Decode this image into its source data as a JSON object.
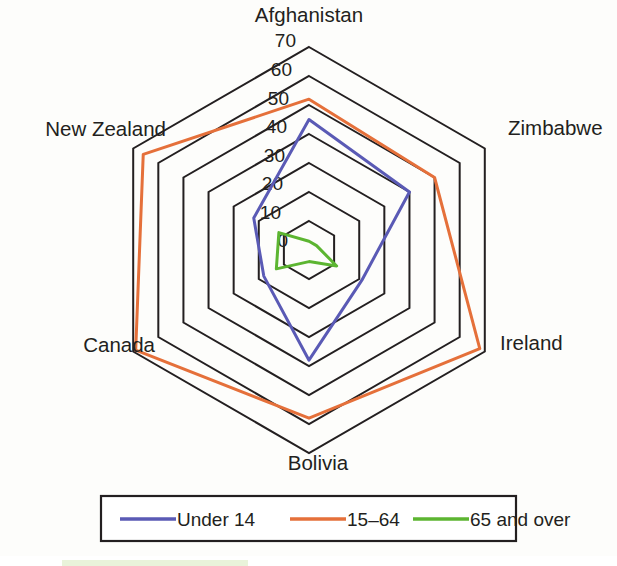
{
  "chart_data": {
    "type": "radar",
    "title": "",
    "subtitle": "",
    "xlabel": "",
    "ylabel": "",
    "categories": [
      "Afghanistan",
      "Zimbabwe",
      "Ireland",
      "Bolivia",
      "Canada",
      "New Zealand"
    ],
    "tick_labels": [
      "70",
      "60",
      "50",
      "40",
      "30",
      "20",
      "10",
      "0"
    ],
    "tick_values": [
      70,
      60,
      50,
      40,
      30,
      20,
      10,
      0
    ],
    "rlim": [
      0,
      70
    ],
    "r_tick_step": 10,
    "grid": true,
    "grid_shape": "polygon",
    "legend_position": "bottom",
    "series": [
      {
        "name": "Under 14",
        "color": "#5a5ab5",
        "values": [
          45,
          40,
          21,
          38,
          18,
          22
        ]
      },
      {
        "name": "15–64",
        "color": "#e5703a",
        "values": [
          52,
          50,
          68,
          58,
          69,
          66
        ]
      },
      {
        "name": "65 and over",
        "color": "#5cb531",
        "values": [
          3,
          3,
          11,
          4,
          13,
          12
        ]
      }
    ]
  },
  "axis_labels": [
    {
      "name": "Afghanistan",
      "x": 309,
      "y": 22,
      "anchor": "middle"
    },
    {
      "name": "Zimbabwe",
      "x": 508,
      "y": 135,
      "anchor": "start"
    },
    {
      "name": "Ireland",
      "x": 500,
      "y": 350,
      "anchor": "start"
    },
    {
      "name": "Bolivia",
      "x": 318,
      "y": 470,
      "anchor": "middle"
    },
    {
      "name": "Canada",
      "x": 155,
      "y": 352,
      "anchor": "end"
    },
    {
      "name": "New Zealand",
      "x": 166,
      "y": 136,
      "anchor": "end"
    }
  ],
  "tick_marks": [
    {
      "label": "70",
      "x": 296,
      "y": 47
    },
    {
      "label": "60",
      "x": 292,
      "y": 76
    },
    {
      "label": "50",
      "x": 289,
      "y": 105
    },
    {
      "label": "40",
      "x": 287,
      "y": 133
    },
    {
      "label": "30",
      "x": 285,
      "y": 162
    },
    {
      "label": "20",
      "x": 283,
      "y": 190
    },
    {
      "label": "10",
      "x": 281,
      "y": 219
    },
    {
      "label": "0",
      "x": 288,
      "y": 247
    }
  ],
  "legend": {
    "entries": [
      {
        "label": "Under 14",
        "color": "#5a5ab5"
      },
      {
        "label": "15–64",
        "color": "#e5703a"
      },
      {
        "label": "65 and over",
        "color": "#5cb531"
      }
    ]
  },
  "colors": {
    "background": "#fdfdfb",
    "grid_line": "#231f20",
    "text": "#231f20",
    "legend_border": "#231f20",
    "accent_strip": "#e9f3da"
  }
}
